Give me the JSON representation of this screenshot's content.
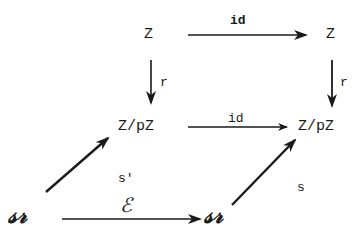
{
  "diagram": {
    "type": "commutative-diagram",
    "nodes": {
      "top_left": "Z",
      "top_right": "Z",
      "mid_left": "Z/pZ",
      "mid_right": "Z/pZ",
      "bottom_left": "𝒜",
      "bottom_right": "𝒜"
    },
    "bottom_node_display": "𝓈𝓇",
    "edges": {
      "top": "id",
      "left_vertical": "r",
      "right_vertical": "r",
      "middle": "id",
      "bottom": "ℰ",
      "left_diagonal": "s'",
      "right_diagonal": "s"
    },
    "colors": {
      "ink": "#1a1a1a",
      "background": "#ffffff"
    }
  }
}
